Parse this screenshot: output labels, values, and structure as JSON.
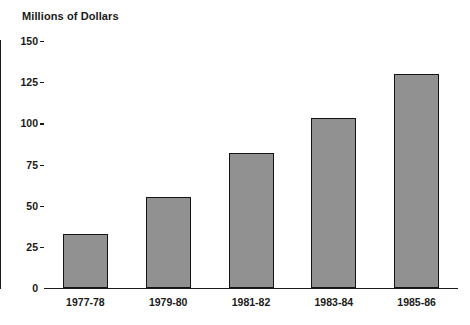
{
  "chart_data": {
    "type": "bar",
    "title": "",
    "ylabel": "Millions of Dollars",
    "xlabel": "",
    "categories": [
      "1977-78",
      "1979-80",
      "1981-82",
      "1983-84",
      "1985-86"
    ],
    "values": [
      33,
      55,
      82,
      103,
      130
    ],
    "ylim": [
      0,
      150
    ],
    "yticks": [
      0,
      25,
      50,
      75,
      100,
      125,
      150
    ],
    "ytick_labels": [
      "0",
      "25",
      "50",
      "75",
      "100",
      "125",
      "150"
    ],
    "grid": false,
    "legend": null,
    "series": [
      {
        "name": "Millions of Dollars",
        "values": [
          33,
          55,
          82,
          103,
          130
        ]
      }
    ],
    "colors": {
      "bar_fill": "#919191",
      "bar_border": "#141414",
      "axis": "#1a1a1a",
      "background": "#ffffff",
      "text": "#1a1a1a"
    }
  }
}
